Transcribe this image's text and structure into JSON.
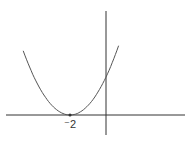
{
  "chart_data": {
    "type": "line",
    "title": "",
    "xlabel": "",
    "ylabel": "",
    "function": "y = (x + 2)^2",
    "series": [
      {
        "name": "parabola",
        "x": [
          -4.6,
          -4,
          -3.5,
          -3,
          -2.5,
          -2,
          -1.5,
          -1,
          -0.5,
          0,
          0.5,
          0.7
        ],
        "values": [
          6.76,
          4,
          2.25,
          1,
          0.25,
          0,
          0.25,
          1,
          2.25,
          4,
          6.25,
          7.29
        ]
      }
    ],
    "annotations": [
      {
        "x": -2,
        "y": 0,
        "label": "⁻2",
        "marker": "dot"
      }
    ],
    "xlim": [
      -3.55,
      4.4
    ],
    "ylim": [
      -2.1,
      10.9
    ],
    "grid": false,
    "legend": "none",
    "colors": {
      "curve": "#555555",
      "axes": "#333333"
    }
  },
  "labels": {
    "vertex_x": "⁻2"
  }
}
